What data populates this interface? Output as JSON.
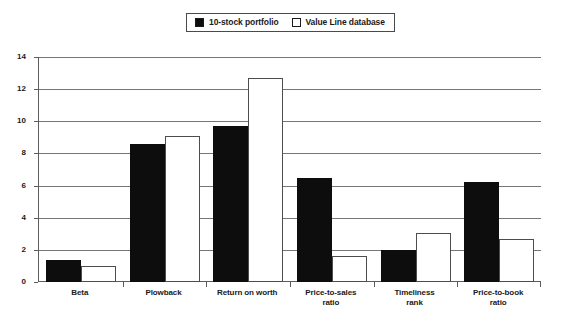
{
  "chart_data": {
    "type": "bar",
    "title": "",
    "subtitle": "",
    "xlabel": "",
    "ylabel": "",
    "ylim": [
      0,
      14
    ],
    "ytick_step": 2,
    "yticks": [
      0,
      2,
      4,
      6,
      8,
      10,
      12,
      14
    ],
    "grid": true,
    "legend_position": "top-center",
    "categories": [
      "Beta",
      "Plowback",
      "Return on worth",
      "Price-to-sales\nratio",
      "Timeliness\nrank",
      "Price-to-book\nratio"
    ],
    "category_lines": [
      [
        "Beta"
      ],
      [
        "Plowback"
      ],
      [
        "Return on worth"
      ],
      [
        "Price-to-sales",
        "ratio"
      ],
      [
        "Timeliness",
        "rank"
      ],
      [
        "Price-to-book",
        "ratio"
      ]
    ],
    "series": [
      {
        "name": "10-stock portfolio",
        "color": "#0d0d0d",
        "fill": "solid",
        "values": [
          1.4,
          8.6,
          9.7,
          6.5,
          2.0,
          6.2
        ]
      },
      {
        "name": "Value Line database",
        "color": "#ffffff",
        "fill": "hollow",
        "values": [
          1.0,
          9.1,
          12.7,
          1.6,
          3.05,
          2.65
        ]
      }
    ]
  },
  "legend": {
    "entries": [
      {
        "label": "10-stock portfolio",
        "swatch": "filled-square-swatch"
      },
      {
        "label": "Value Line database",
        "swatch": "hollow-square-swatch"
      }
    ]
  },
  "colors": {
    "series_1_fill": "#0d0d0d",
    "series_2_fill": "#ffffff",
    "series_2_border": "#4d4d4d",
    "gridline": "#777777",
    "axis": "#5d5d5d",
    "text": "#1a1a1a",
    "background": "#ffffff"
  }
}
